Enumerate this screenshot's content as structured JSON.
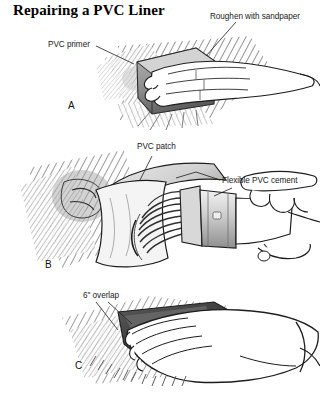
{
  "figure": {
    "title": "Repairing a PVC Liner",
    "width": 320,
    "height": 396,
    "background_color": "#ffffff",
    "ink_color": "#1a1a1a",
    "style": "black-and-white pen-and-ink technical illustration with pencil hatching"
  },
  "callouts": {
    "roughen": "Roughen with sandpaper",
    "primer": "PVC primer",
    "patch": "PVC patch",
    "cement": "Flexible PVC cement",
    "overlap": "6\" overlap"
  },
  "panels": [
    {
      "letter": "A",
      "description": "A hand holds a sanding block and abrades the PVC liner surface; the roughened area is shown with dense diagonal hatching. A small puddle of PVC primer is indicated at the left edge of the sanded zone.",
      "callouts": [
        "roughen",
        "primer"
      ]
    },
    {
      "letter": "B",
      "description": "A hand holds a paintbrush with a metal ferrule and spreads flexible PVC cement in sweeping strokes over the prepared liner; the PVC patch is curled back at the upper left.",
      "callouts": [
        "patch",
        "cement"
      ]
    },
    {
      "letter": "C",
      "description": "A hand presses the PVC patch flat onto the cemented liner, smoothing it outward; the patch margin extends six inches past the damaged area.",
      "callouts": [
        "overlap"
      ]
    }
  ]
}
